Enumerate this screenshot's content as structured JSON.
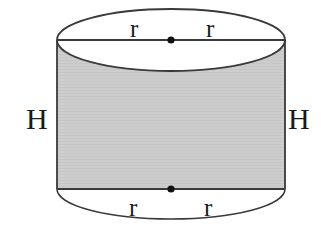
{
  "figure": {
    "kind": "cylinder-diagram",
    "canvas": {
      "width": 321,
      "height": 248
    },
    "background_color": "#ffffff",
    "body_fill_color": "#cdcdcd",
    "stroke_color": "#3a3a3a",
    "label_color": "#1a1a1a"
  },
  "labels": {
    "radius_top_left": "r",
    "radius_top_right": "r",
    "radius_bottom_left": "r",
    "radius_bottom_right": "r",
    "height_left": "H",
    "height_right": "H"
  },
  "geometry": {
    "left_x": 57,
    "right_x": 285,
    "radius_x": 114,
    "top_center_y": 40,
    "bottom_center_y": 189,
    "top_radius_y": 31,
    "bottom_radius_y": 30,
    "center_x": 171,
    "body_height": 149
  },
  "markers": {
    "top_center_dot": "center-point",
    "bottom_center_dot": "center-point"
  }
}
